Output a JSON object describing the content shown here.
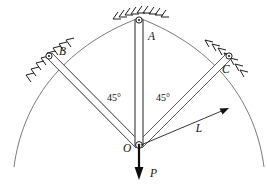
{
  "figure": {
    "kind": "statics-free-body-diagram",
    "background_color": "#ffffff",
    "line_color": "#555555",
    "arc_color": "#6b6b6b",
    "hatch_color": "#1c1c1c",
    "force_color": "#0d0d0d"
  },
  "labels": {
    "joint_a": "A",
    "joint_b": "B",
    "joint_c": "C",
    "joint_o": "O",
    "length": "L",
    "force": "P",
    "angle_left": "45°",
    "angle_right": "45°"
  },
  "geometry": {
    "center": {
      "x": 139,
      "y": 145
    },
    "radius": 127,
    "joints": [
      {
        "name": "A",
        "x": 139,
        "y": 19,
        "angle_deg": 90
      },
      {
        "name": "B",
        "x": 49,
        "y": 56,
        "angle_deg": 135
      },
      {
        "name": "C",
        "x": 229,
        "y": 56,
        "angle_deg": 45
      }
    ],
    "arc_start_deg": 10,
    "arc_end_deg": 170,
    "bar_half_width": 2.6
  },
  "force_vector": {
    "label": "P",
    "from": {
      "x": 139,
      "y": 145
    },
    "to": {
      "x": 139,
      "y": 180
    },
    "direction": "down"
  },
  "dimension": {
    "label": "L",
    "from": {
      "x": 140,
      "y": 145
    },
    "to": {
      "x": 229,
      "y": 108
    }
  }
}
